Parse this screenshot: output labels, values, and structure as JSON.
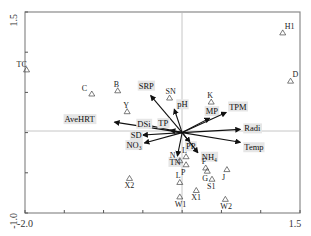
{
  "chart_data": {
    "type": "scatter",
    "subtype": "ordination-biplot",
    "title": "",
    "xlabel": "",
    "ylabel": "",
    "xlim": [
      -2.0,
      1.5
    ],
    "ylim": [
      -1.0,
      1.5
    ],
    "x_tick_labels": [
      "-2.0",
      "1.5"
    ],
    "y_tick_labels": [
      "1.5",
      "-1.0"
    ],
    "x_ticks": [
      -2.0,
      -1.5,
      -1.0,
      -0.5,
      0.0,
      0.5,
      1.0,
      1.5
    ],
    "y_ticks": [
      -1.0,
      -0.5,
      0.0,
      0.5,
      1.0,
      1.5
    ],
    "grid": false,
    "reference_lines": {
      "x": 0,
      "y": 0
    },
    "sites": [
      {
        "label": "TC",
        "x": -1.98,
        "y": 0.78
      },
      {
        "label": "C",
        "x": -1.15,
        "y": 0.48
      },
      {
        "label": "B",
        "x": -0.82,
        "y": 0.52
      },
      {
        "label": "Y",
        "x": -0.7,
        "y": 0.26
      },
      {
        "label": "SN",
        "x": -0.16,
        "y": 0.43
      },
      {
        "label": "K",
        "x": 0.37,
        "y": 0.38
      },
      {
        "label": "H1",
        "x": 1.28,
        "y": 1.24
      },
      {
        "label": "D",
        "x": 1.38,
        "y": 0.64
      },
      {
        "label": "L",
        "x": 0.05,
        "y": -0.3
      },
      {
        "label": "N",
        "x": -0.03,
        "y": -0.35
      },
      {
        "label": "P",
        "x": 0.05,
        "y": -0.4
      },
      {
        "label": "F",
        "x": 0.3,
        "y": -0.44
      },
      {
        "label": "G",
        "x": 0.32,
        "y": -0.48
      },
      {
        "label": "J",
        "x": 0.57,
        "y": -0.46
      },
      {
        "label": "S1",
        "x": 0.38,
        "y": -0.58
      },
      {
        "label": "X2",
        "x": -0.67,
        "y": -0.57
      },
      {
        "label": "L",
        "x": -0.03,
        "y": -0.62
      },
      {
        "label": "X1",
        "x": 0.18,
        "y": -0.72
      },
      {
        "label": "W1",
        "x": -0.03,
        "y": -0.8
      },
      {
        "label": "W2",
        "x": 0.55,
        "y": -0.83
      }
    ],
    "env_vectors": [
      {
        "label": "SRP",
        "x": -0.4,
        "y": 0.46
      },
      {
        "label": "pH",
        "x": -0.1,
        "y": 0.29
      },
      {
        "label": "MP",
        "x": 0.35,
        "y": 0.18
      },
      {
        "label": "TPM",
        "x": 0.56,
        "y": 0.25
      },
      {
        "label": "Radi",
        "x": 0.74,
        "y": 0.04
      },
      {
        "label": "Temp",
        "x": 0.74,
        "y": -0.12
      },
      {
        "label": "AveHRT",
        "x": -0.86,
        "y": 0.13
      },
      {
        "label": "DSi",
        "x": -0.52,
        "y": 0.11
      },
      {
        "label": "TP",
        "x": -0.15,
        "y": 0.03
      },
      {
        "label": "SD",
        "x": -0.5,
        "y": -0.03
      },
      {
        "label": "NO₃",
        "x": -0.48,
        "y": -0.13
      },
      {
        "label": "TN",
        "x": -0.06,
        "y": -0.29
      },
      {
        "label": "PP",
        "x": 0.1,
        "y": -0.12
      },
      {
        "label": "NH₄",
        "x": 0.2,
        "y": -0.25
      }
    ]
  },
  "labels": {
    "x_min": "-2.0",
    "x_max": "1.5",
    "y_max": "1.5",
    "y_min": "-1.0"
  }
}
